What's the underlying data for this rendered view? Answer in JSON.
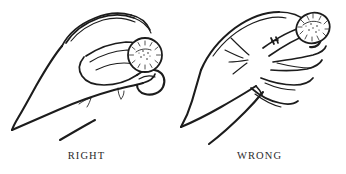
{
  "illustration": {
    "background_color": "#ffffff",
    "ink_color": "#1c1c1c",
    "caption_color": "#2b2b2b",
    "panels": [
      {
        "key": "right",
        "caption": "RIGHT",
        "subject": "hand holding coin between thumb and index finger pad",
        "object": "coin-with-radial-ticks"
      },
      {
        "key": "wrong",
        "caption": "WRONG",
        "subject": "hand holding coin at fingertips with splayed fingers",
        "object": "coin-with-radial-ticks",
        "emphasis_marks": "radiating stress lines near knuckles"
      }
    ]
  }
}
